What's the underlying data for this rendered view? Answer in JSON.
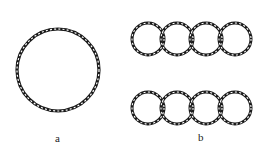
{
  "figure": {
    "panels": [
      {
        "label": "a",
        "description": "single closed twisted-strand ring"
      },
      {
        "label": "b",
        "description": "two rows of four interlinked twisted-strand rings"
      }
    ],
    "colors": {
      "stroke": "#1a1a1a",
      "background": "#ffffff"
    }
  }
}
